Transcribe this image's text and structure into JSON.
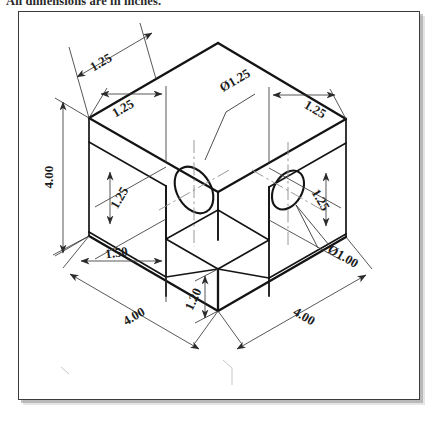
{
  "caption": {
    "text": "All dimensions are in inches."
  },
  "figure": {
    "frame": {
      "border_color": "#3b3b3b",
      "background": "#ffffff"
    },
    "line_color": "#1a1a1a",
    "dim_color": "#3a3a3a",
    "center_line_color": "#8a8a8a"
  },
  "dimensions": [
    {
      "id": "top-depth",
      "label": "1.25",
      "kind": "linear",
      "location": "top-left-edge"
    },
    {
      "id": "left-height",
      "label": "4.00",
      "kind": "linear",
      "location": "far-left-vertical"
    },
    {
      "id": "left-wall-thk",
      "label": "1.25",
      "kind": "linear",
      "location": "left-face-upper"
    },
    {
      "id": "left-hole-height",
      "label": "1.25",
      "kind": "linear",
      "location": "left-face-vertical"
    },
    {
      "id": "hole-left-dia",
      "label": "Ø1.25",
      "kind": "diameter",
      "location": "left-hole-leader"
    },
    {
      "id": "right-wall-thk",
      "label": "1.25",
      "kind": "linear",
      "location": "right-face-upper"
    },
    {
      "id": "right-hole-height",
      "label": "1.25",
      "kind": "linear",
      "location": "right-face-vertical"
    },
    {
      "id": "hole-right-dia",
      "label": "Ø1.00",
      "kind": "diameter",
      "location": "right-hole-leader"
    },
    {
      "id": "floor-thickness",
      "label": "1.50",
      "kind": "linear",
      "location": "lower-left"
    },
    {
      "id": "base-height",
      "label": "1.20",
      "kind": "linear",
      "location": "front-vertical"
    },
    {
      "id": "width-front-left",
      "label": "4.00",
      "kind": "linear",
      "location": "bottom-left-edge"
    },
    {
      "id": "width-front-right",
      "label": "4.00",
      "kind": "linear",
      "location": "bottom-right-edge"
    }
  ],
  "labels": {
    "d_top_depth": "1.25",
    "d_left_height": "4.00",
    "d_left_wall": "1.25",
    "d_left_hole_h": "1.25",
    "d_hole_left": "Ø1.25",
    "d_right_wall": "1.25",
    "d_right_hole_h": "1.25",
    "d_hole_right": "Ø1.00",
    "d_floor": "1.50",
    "d_base": "1.20",
    "d_width_left": "4.00",
    "d_width_right": "4.00"
  }
}
